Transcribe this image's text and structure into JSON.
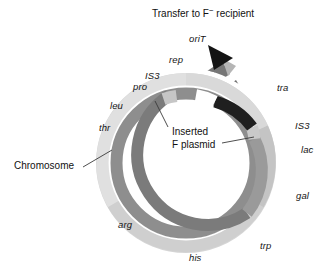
{
  "title": {
    "text_before": "Transfer to F",
    "superscript": "−",
    "text_after": " recipient"
  },
  "callouts": [
    {
      "name": "chromosome",
      "label": "Chromosome"
    },
    {
      "name": "inserted-f-plasmid",
      "line1": "Inserted",
      "line2": "F plasmid"
    }
  ],
  "chromosome_genes": [
    {
      "id": "pro",
      "label": "pro"
    },
    {
      "id": "leu",
      "label": "leu"
    },
    {
      "id": "thr",
      "label": "thr"
    },
    {
      "id": "arg",
      "label": "arg"
    },
    {
      "id": "his",
      "label": "his"
    },
    {
      "id": "trp",
      "label": "trp"
    },
    {
      "id": "gal",
      "label": "gal"
    },
    {
      "id": "lac",
      "label": "lac"
    }
  ],
  "plasmid_features": [
    {
      "id": "oriT",
      "label": "oriT"
    },
    {
      "id": "rep",
      "label": "rep"
    },
    {
      "id": "is3-left",
      "label": "IS3"
    },
    {
      "id": "is3-right",
      "label": "IS3"
    },
    {
      "id": "tra",
      "label": "tra"
    }
  ],
  "colors": {
    "chromosome_ring": "#d2d2d2",
    "chromosome_ring_light": "#dcdcdc",
    "plasmid_ring": "#8c8c8c",
    "plasmid_ring_dark": "#6f6f6f",
    "tra_band": "#1e1e1e",
    "is3_band": "#c9c9c9",
    "arrowhead": "#141414",
    "background": "#ffffff",
    "text": "#111111",
    "leader_line": "#3a3a3a"
  }
}
